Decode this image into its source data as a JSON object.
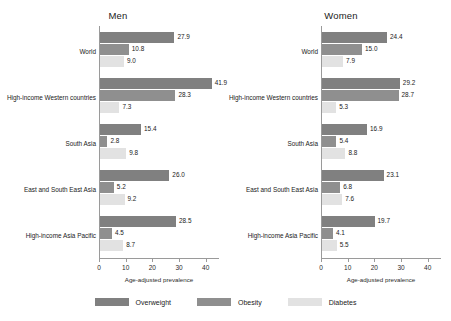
{
  "chart_data": {
    "type": "bar",
    "title": "",
    "orientation": "horizontal",
    "xlabel": "Age-adjusted prevalence",
    "ylabel": "",
    "xlim": [
      0,
      45
    ],
    "xticks": [
      "0",
      "10",
      "20",
      "30",
      "40"
    ],
    "xtick_values": [
      0,
      10,
      20,
      30,
      40
    ],
    "grid": false,
    "legend_position": "bottom-center",
    "categories": [
      "World",
      "High-income Western countries",
      "South Asia",
      "East and South East Asia",
      "High-income Asia Pacific"
    ],
    "series": [
      {
        "name": "Overweight",
        "color": "#808080"
      },
      {
        "name": "Obesity",
        "color": "#8f8f8f"
      },
      {
        "name": "Diabetes",
        "color": "#e2e2e2"
      }
    ],
    "panels": [
      {
        "title": "Men",
        "groups": [
          {
            "category": "World",
            "values": [
              27.9,
              10.8,
              9.0
            ],
            "labels": [
              "27.9",
              "10.8",
              "9.0"
            ]
          },
          {
            "category": "High-income Western countries",
            "values": [
              41.9,
              28.3,
              7.3
            ],
            "labels": [
              "41.9",
              "28.3",
              "7.3"
            ]
          },
          {
            "category": "South Asia",
            "values": [
              15.4,
              2.8,
              9.8
            ],
            "labels": [
              "15.4",
              "2.8",
              "9.8"
            ]
          },
          {
            "category": "East and South East Asia",
            "values": [
              26.0,
              5.2,
              9.2
            ],
            "labels": [
              "26.0",
              "5.2",
              "9.2"
            ]
          },
          {
            "category": "High-income Asia Pacific",
            "values": [
              28.5,
              4.5,
              8.7
            ],
            "labels": [
              "28.5",
              "4.5",
              "8.7"
            ]
          }
        ]
      },
      {
        "title": "Women",
        "groups": [
          {
            "category": "World",
            "values": [
              24.4,
              15.0,
              7.9
            ],
            "labels": [
              "24.4",
              "15.0",
              "7.9"
            ]
          },
          {
            "category": "High-income Western countries",
            "values": [
              29.2,
              28.7,
              5.3
            ],
            "labels": [
              "29.2",
              "28.7",
              "5.3"
            ]
          },
          {
            "category": "South Asia",
            "values": [
              16.9,
              5.4,
              8.8
            ],
            "labels": [
              "16.9",
              "5.4",
              "8.8"
            ]
          },
          {
            "category": "East and South East Asia",
            "values": [
              23.1,
              6.8,
              7.6
            ],
            "labels": [
              "23.1",
              "6.8",
              "7.6"
            ]
          },
          {
            "category": "High-income Asia Pacific",
            "values": [
              19.7,
              4.1,
              5.5
            ],
            "labels": [
              "19.7",
              "4.1",
              "5.5"
            ]
          }
        ]
      }
    ]
  },
  "legend": {
    "items": [
      {
        "label": "Overweight",
        "color": "#808080"
      },
      {
        "label": "Obesity",
        "color": "#8f8f8f"
      },
      {
        "label": "Diabetes",
        "color": "#e2e2e2"
      }
    ]
  }
}
